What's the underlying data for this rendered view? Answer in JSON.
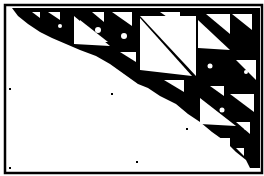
{
  "figure": {
    "colors": {
      "foreground": "#000000",
      "background": "#ffffff"
    }
  }
}
